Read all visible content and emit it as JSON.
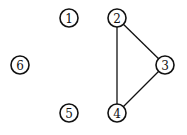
{
  "graph": {
    "width": 187,
    "height": 135,
    "node_radius": 9,
    "nodes": [
      {
        "id": "1",
        "label": "1",
        "x": 69,
        "y": 18
      },
      {
        "id": "2",
        "label": "2",
        "x": 117,
        "y": 18
      },
      {
        "id": "3",
        "label": "3",
        "x": 165,
        "y": 65
      },
      {
        "id": "4",
        "label": "4",
        "x": 117,
        "y": 113
      },
      {
        "id": "5",
        "label": "5",
        "x": 69,
        "y": 113
      },
      {
        "id": "6",
        "label": "6",
        "x": 20,
        "y": 65
      }
    ],
    "edges": [
      {
        "from": "2",
        "to": "3"
      },
      {
        "from": "2",
        "to": "4"
      },
      {
        "from": "3",
        "to": "4"
      }
    ]
  }
}
